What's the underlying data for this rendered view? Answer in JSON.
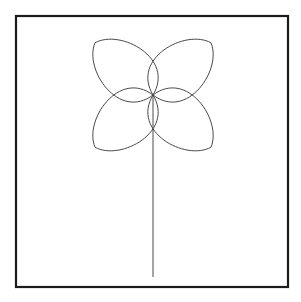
{
  "canvas": {
    "width": 301,
    "height": 302,
    "background_color": "#ffffff",
    "title": "Four-petal rose flower line drawing"
  },
  "frame": {
    "name": "border-frame",
    "x": 16,
    "y": 16,
    "width": 272,
    "height": 271,
    "stroke_color": "#1c1c1c",
    "stroke_width": 2.2,
    "fill": "none"
  },
  "drawing": {
    "stroke_color": "#4a4a4a",
    "stroke_width": 1,
    "center_x": 153,
    "center_y": 95,
    "flower": {
      "name": "four-petal-rose",
      "petal_count": 4,
      "petal_length": 78,
      "petal_width": 46,
      "petal_angles_deg": [
        222,
        318,
        42,
        138
      ],
      "bounds": {
        "left": 88,
        "top": 30,
        "right": 219,
        "bottom": 149
      }
    },
    "stem": {
      "name": "flower-stem",
      "x": 153,
      "y_top": 95,
      "y_bottom": 277,
      "length": 182
    }
  },
  "chart_data": {
    "type": "line",
    "curve_equation": "r = a · cos(2θ)",
    "parameters": {
      "a": 78,
      "k": 2,
      "rotation_deg": 45
    },
    "center": [
      153,
      95
    ],
    "petal_tips": [
      [
        98,
        40
      ],
      [
        208,
        40
      ],
      [
        208,
        150
      ],
      [
        98,
        150
      ]
    ],
    "stem_endpoints": [
      [
        153,
        95
      ],
      [
        153,
        277
      ]
    ],
    "xlabel": "",
    "ylabel": "",
    "grid": false,
    "legend": "none"
  }
}
